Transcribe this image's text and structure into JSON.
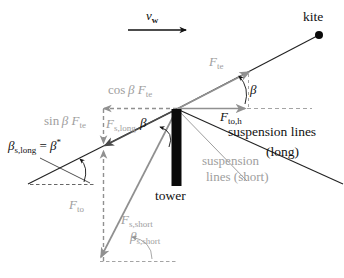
{
  "labels": {
    "kite": "kite",
    "wind_speed": {
      "var": "v",
      "sub": "w"
    },
    "tether_force": {
      "var": "F",
      "sub": "te"
    },
    "beta_tether": "β",
    "tower_force_horizontal": {
      "var": "F",
      "sub": "to,h"
    },
    "suspension_long_line1": "suspension lines",
    "suspension_long_line2": "(long)",
    "suspension_short_line1": "suspension",
    "suspension_short_line2": "lines (short)",
    "cos_component": {
      "fn": "cos",
      "var": "β F",
      "sub": "te"
    },
    "sin_component": {
      "fn": "sin",
      "var": "β F",
      "sub": "te"
    },
    "suspension_long_force": {
      "var": "F",
      "sub": "s,long"
    },
    "beta_center": "β",
    "beta_long_eq": {
      "var1": "β",
      "sub1": "s,long",
      "eq": " = ",
      "var2": "β",
      "sup": "*"
    },
    "tower": "tower",
    "tower_force": {
      "var": "F",
      "sub": "to"
    },
    "suspension_short_force": {
      "var": "F",
      "sub": "s,short"
    },
    "beta_short": {
      "var": "β",
      "sub": "s,short"
    }
  },
  "colors": {
    "ink": "#111111",
    "line_black": "#222222",
    "gray_vector": "#909090",
    "gray_text": "#9e9e9e"
  }
}
